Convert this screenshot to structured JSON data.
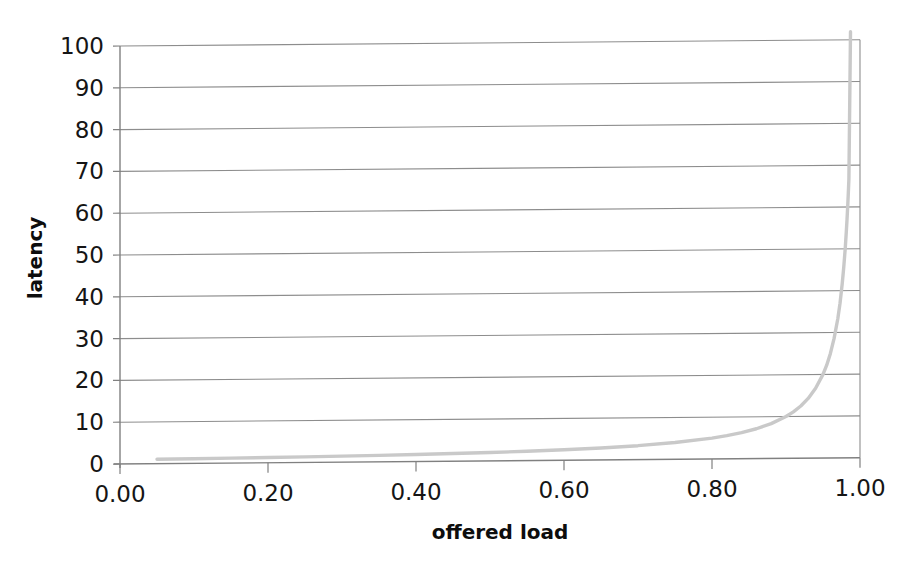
{
  "chart_data": {
    "type": "line",
    "title": "",
    "xlabel": "offered load",
    "ylabel": "latency",
    "xlim": [
      0.0,
      1.0
    ],
    "ylim": [
      0,
      100
    ],
    "grid": "horizontal",
    "legend": "none",
    "series_color": "#c9c9c9",
    "gridline_color": "#8d8d8d",
    "axis_color": "#808080",
    "xticks": [
      "0.00",
      "0.20",
      "0.40",
      "0.60",
      "0.80",
      "1.00"
    ],
    "xtick_values": [
      0.0,
      0.2,
      0.4,
      0.6,
      0.8,
      1.0
    ],
    "yticks": [
      "0",
      "10",
      "20",
      "30",
      "40",
      "50",
      "60",
      "70",
      "80",
      "90",
      "100"
    ],
    "ytick_values": [
      0,
      10,
      20,
      30,
      40,
      50,
      60,
      70,
      80,
      90,
      100
    ],
    "series": [
      {
        "name": "latency",
        "x": [
          0.05,
          0.1,
          0.15,
          0.2,
          0.25,
          0.3,
          0.35,
          0.4,
          0.45,
          0.5,
          0.55,
          0.6,
          0.65,
          0.7,
          0.75,
          0.8,
          0.82,
          0.84,
          0.86,
          0.88,
          0.9,
          0.91,
          0.92,
          0.93,
          0.94,
          0.95,
          0.955,
          0.96,
          0.965,
          0.97,
          0.973,
          0.976,
          0.978,
          0.98,
          0.9815,
          0.9825,
          0.9835,
          0.984,
          0.9845,
          0.985
        ],
        "y": [
          1.05,
          1.11,
          1.18,
          1.25,
          1.33,
          1.43,
          1.54,
          1.67,
          1.82,
          2.0,
          2.22,
          2.5,
          2.86,
          3.33,
          4.0,
          5.0,
          5.56,
          6.25,
          7.14,
          8.33,
          10.0,
          11.1,
          12.5,
          14.3,
          16.7,
          20.0,
          22.2,
          25.0,
          28.6,
          33.3,
          37.0,
          41.7,
          45.5,
          50.0,
          54.1,
          57.1,
          60.6,
          62.5,
          64.5,
          66.7
        ]
      }
    ]
  }
}
